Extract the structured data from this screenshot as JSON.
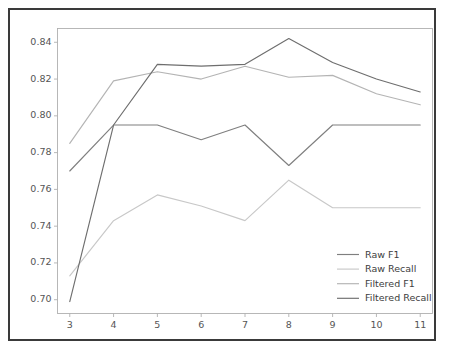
{
  "figure": {
    "background_color": "#ffffff",
    "frame_color": "#3a3a3a",
    "axes_color": "#b0b0b0",
    "tick_label_color": "#555555"
  },
  "chart_data": {
    "type": "line",
    "title": "",
    "xlabel": "",
    "ylabel": "",
    "x": [
      3,
      4,
      5,
      6,
      7,
      8,
      9,
      10,
      11
    ],
    "xticks": [
      "3",
      "4",
      "5",
      "6",
      "7",
      "8",
      "9",
      "10",
      "11"
    ],
    "yticks": [
      "0.70",
      "0.72",
      "0.74",
      "0.76",
      "0.78",
      "0.80",
      "0.82",
      "0.84"
    ],
    "ytick_values": [
      0.7,
      0.72,
      0.74,
      0.76,
      0.78,
      0.8,
      0.82,
      0.84
    ],
    "xlim": [
      2.72,
      11.28
    ],
    "ylim": [
      0.6925,
      0.8475
    ],
    "grid": false,
    "legend_position": "lower right",
    "series": [
      {
        "name": "Raw F1",
        "color": "#7f7f7f",
        "values": [
          0.77,
          0.795,
          0.795,
          0.787,
          0.795,
          0.773,
          0.795,
          0.795,
          0.795
        ]
      },
      {
        "name": "Raw Recall",
        "color": "#c8c8c8",
        "values": [
          0.713,
          0.743,
          0.757,
          0.751,
          0.743,
          0.765,
          0.75,
          0.75,
          0.75
        ]
      },
      {
        "name": "Filtered F1",
        "color": "#b4b4b4",
        "values": [
          0.785,
          0.819,
          0.824,
          0.82,
          0.827,
          0.821,
          0.822,
          0.812,
          0.806
        ]
      },
      {
        "name": "Filtered Recall",
        "color": "#6e6e6e",
        "values": [
          0.699,
          0.795,
          0.828,
          0.827,
          0.828,
          0.842,
          0.829,
          0.82,
          0.813
        ]
      }
    ]
  }
}
